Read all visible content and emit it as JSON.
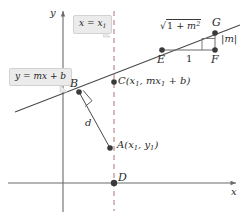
{
  "figure": {
    "type": "geometry-diagram",
    "width": 247,
    "height": 219,
    "background": "#ffffff"
  },
  "axes": {
    "x_label": "x",
    "y_label": "y",
    "x_axis_y": 183,
    "y_axis_x": 63,
    "color": "#6b6b6b"
  },
  "line": {
    "equation_label": "y = mx + b",
    "callout_text": "y = mx + b",
    "color": "#4a4a4a"
  },
  "vertical": {
    "callout_text": "x = x₁",
    "equation_label": "x = x₁",
    "style": "dashed",
    "color": "#b08080",
    "x": 114
  },
  "points": [
    {
      "id": "A",
      "label": "A(x₁, y₁)",
      "x": 110,
      "y": 148
    },
    {
      "id": "B",
      "label": "B",
      "x": 79,
      "y": 92
    },
    {
      "id": "C",
      "label": "C(x₁, mx₁ + b)",
      "x": 114,
      "y": 82
    },
    {
      "id": "D",
      "label": "D",
      "x": 114,
      "y": 183
    },
    {
      "id": "E",
      "label": "E",
      "x": 162,
      "y": 50
    },
    {
      "id": "F",
      "label": "F",
      "x": 215,
      "y": 50
    },
    {
      "id": "G",
      "label": "G",
      "x": 215,
      "y": 33
    }
  ],
  "segments": {
    "distance_label": "d",
    "run_label": "1",
    "rise_label": "|m|",
    "hypotenuse_label": "√(1 + m²)"
  },
  "slope_triangle": {
    "run": "1",
    "rise": "|m|",
    "hypotenuse": "√(1 + m²)",
    "right_angle_at": "F"
  },
  "right_angles": [
    {
      "at": "B",
      "between": [
        "line",
        "d"
      ]
    },
    {
      "at": "F",
      "between": [
        "run",
        "rise"
      ]
    }
  ],
  "colors": {
    "line": "#4a4a4a",
    "axis": "#6b6b6b",
    "dashed": "#b08080",
    "point_fill": "#3a3a3a",
    "callout_bg": "#ebebeb",
    "callout_border": "#d2d2d2",
    "text": "#2a2a2a"
  }
}
